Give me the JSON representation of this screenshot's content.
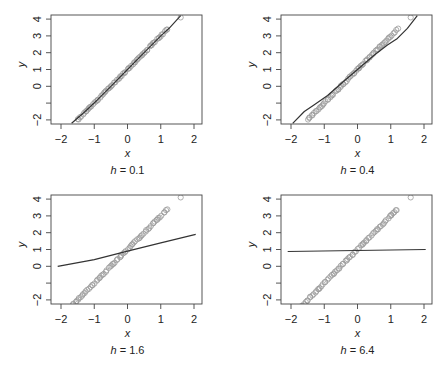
{
  "figure": {
    "layout": "2x2 grid",
    "axis_color": "#444444",
    "line_color": "#333333",
    "point_color": "#9a9a9a"
  },
  "chart_data": [
    {
      "type": "scatter",
      "title": "h = 0.1",
      "caption_var": "h",
      "caption_value": "0.1",
      "xlabel": "x",
      "ylabel": "y",
      "xlim": [
        -2.3,
        2.25
      ],
      "ylim": [
        -2.2,
        4.2
      ],
      "xticks": [
        -2,
        -1,
        0,
        1,
        2
      ],
      "yticks": [
        -2,
        -1,
        0,
        1,
        2,
        3,
        4
      ],
      "ytick_labels": [
        "-2",
        "",
        "0",
        "1",
        "2",
        "3",
        "4"
      ],
      "points": {
        "description": "open circles along y = 1 + 2x",
        "x_range": [
          -1.5,
          1.2
        ],
        "outlier": [
          1.6,
          4.1
        ]
      },
      "fit_line": [
        [
          -1.68,
          -2.2
        ],
        [
          -1.3,
          -1.55
        ],
        [
          -0.9,
          -0.8
        ],
        [
          -0.5,
          0.0
        ],
        [
          0.0,
          1.0
        ],
        [
          0.5,
          2.0
        ],
        [
          1.0,
          3.0
        ],
        [
          1.25,
          3.45
        ],
        [
          1.6,
          4.2
        ]
      ]
    },
    {
      "type": "scatter",
      "title": "h = 0.4",
      "caption_var": "h",
      "caption_value": "0.4",
      "xlabel": "x",
      "ylabel": "y",
      "xlim": [
        -2.3,
        2.25
      ],
      "ylim": [
        -2.2,
        4.2
      ],
      "xticks": [
        -2,
        -1,
        0,
        1,
        2
      ],
      "yticks": [
        -2,
        -1,
        0,
        1,
        2,
        3,
        4
      ],
      "ytick_labels": [
        "-2",
        "",
        "0",
        "1",
        "2",
        "3",
        "4"
      ],
      "points": {
        "description": "open circles along y = 1 + 2x",
        "x_range": [
          -1.5,
          1.2
        ],
        "outlier": [
          1.6,
          4.1
        ]
      },
      "fit_line": [
        [
          -1.95,
          -2.2
        ],
        [
          -1.6,
          -1.5
        ],
        [
          -1.3,
          -1.1
        ],
        [
          -0.9,
          -0.55
        ],
        [
          -0.5,
          0.15
        ],
        [
          0.0,
          1.0
        ],
        [
          0.5,
          1.85
        ],
        [
          0.9,
          2.45
        ],
        [
          1.2,
          2.85
        ],
        [
          1.5,
          3.45
        ],
        [
          1.8,
          4.2
        ]
      ]
    },
    {
      "type": "scatter",
      "title": "h = 1.6",
      "caption_var": "h",
      "caption_value": "1.6",
      "xlabel": "x",
      "ylabel": "y",
      "xlim": [
        -2.3,
        2.25
      ],
      "ylim": [
        -2.2,
        4.2
      ],
      "xticks": [
        -2,
        -1,
        0,
        1,
        2
      ],
      "yticks": [
        -2,
        -1,
        0,
        1,
        2,
        3,
        4
      ],
      "ytick_labels": [
        "-2",
        "",
        "0",
        "1",
        "2",
        "3",
        "4"
      ],
      "points": {
        "description": "open circles along y = 1 + 2x",
        "x_range": [
          -1.65,
          1.2
        ],
        "outlier": [
          1.6,
          4.1
        ]
      },
      "fit_line": [
        [
          -2.1,
          0.0
        ],
        [
          -1.0,
          0.4
        ],
        [
          0.0,
          0.9
        ],
        [
          1.0,
          1.4
        ],
        [
          2.05,
          1.9
        ]
      ]
    },
    {
      "type": "scatter",
      "title": "h = 6.4",
      "caption_var": "h",
      "caption_value": "6.4",
      "xlabel": "x",
      "ylabel": "y",
      "xlim": [
        -2.3,
        2.25
      ],
      "ylim": [
        -2.2,
        4.2
      ],
      "xticks": [
        -2,
        -1,
        0,
        1,
        2
      ],
      "yticks": [
        -2,
        -1,
        0,
        1,
        2,
        3,
        4
      ],
      "ytick_labels": [
        "-2",
        "",
        "0",
        "1",
        "2",
        "3",
        "4"
      ],
      "points": {
        "description": "open circles along y = 1 + 2x",
        "x_range": [
          -1.65,
          1.2
        ],
        "outlier": [
          1.6,
          4.1
        ]
      },
      "fit_line": [
        [
          -2.1,
          0.88
        ],
        [
          2.05,
          1.0
        ]
      ]
    }
  ]
}
